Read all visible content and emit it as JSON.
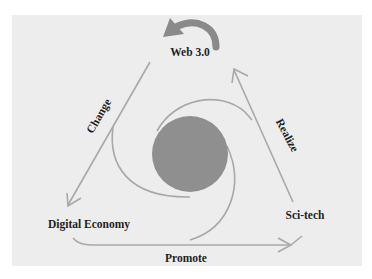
{
  "diagram": {
    "nodes": {
      "top": "Web 3.0",
      "left": "Digital Economy",
      "right": "Sci-tech"
    },
    "edges": {
      "left_side": "Change",
      "right_side": "Realize",
      "bottom": "Promote"
    },
    "colors": {
      "background": "#ededed",
      "center_circle": "#8f8f8f",
      "lines": "#a8a8a8",
      "curved_arrow": "#8a8a8a",
      "text": "#1f1f1f"
    }
  }
}
